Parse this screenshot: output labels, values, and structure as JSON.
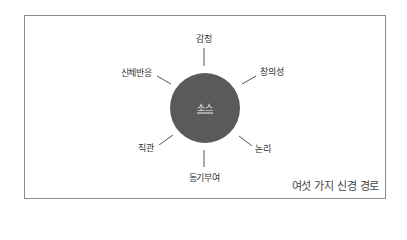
{
  "diagram": {
    "title": "여섯 가지 신경 경로",
    "center": {
      "label": "소스",
      "fill": "#5a5a5a"
    },
    "nodes": [
      {
        "label": "감정",
        "position": "top"
      },
      {
        "label": "창의성",
        "position": "top-right"
      },
      {
        "label": "논리",
        "position": "bottom-right"
      },
      {
        "label": "동기부여",
        "position": "bottom"
      },
      {
        "label": "직관",
        "position": "bottom-left"
      },
      {
        "label": "신체반응",
        "position": "top-left"
      }
    ],
    "colors": {
      "frame": "#8c8c8c",
      "spoke": "#555555",
      "circle": "#5a5a5a"
    }
  }
}
